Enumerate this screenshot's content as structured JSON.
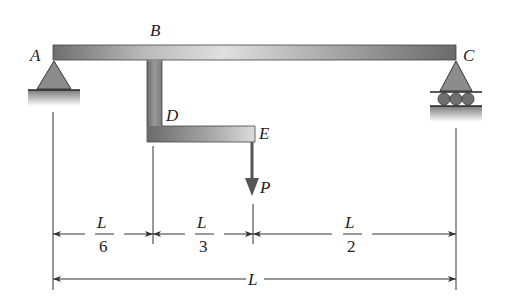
{
  "diagram": {
    "type": "beam-structure",
    "points": {
      "A": "A",
      "B": "B",
      "C": "C",
      "D": "D",
      "E": "E"
    },
    "load": {
      "label": "P",
      "direction": "down"
    },
    "supports": {
      "left": "pin",
      "right": "roller"
    },
    "dimensions": {
      "segment1": {
        "num": "L",
        "den": "6"
      },
      "segment2": {
        "num": "L",
        "den": "3"
      },
      "segment3": {
        "num": "L",
        "den": "2"
      },
      "total": "L"
    },
    "colors": {
      "member_dark": "#5a5a5a",
      "member_light": "#d4d4d4",
      "support_fill": "#8a8a8a",
      "line": "#333333"
    }
  }
}
